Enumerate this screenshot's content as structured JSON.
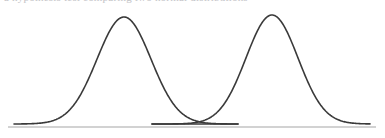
{
  "figure": {
    "width": 385,
    "height": 138,
    "background_color": "#ffffff",
    "clipped_text_fragment": "a hypothesis test comparing two normal distributions",
    "curve_color": "#3a3a3a",
    "baseline_color": "#d2d2d2",
    "curve_stroke_width": 1.6,
    "baseline_stroke_width": 2.0
  },
  "chart_data": {
    "type": "line",
    "title": "",
    "subtitle": "",
    "xlabel": "",
    "ylabel": "",
    "grid": false,
    "legend_position": "none",
    "axis_visible": false,
    "baseline_visible": true,
    "xlim": [
      0,
      385
    ],
    "ylim": [
      0,
      138
    ],
    "baseline_y": 127,
    "baselines": [
      {
        "name": "main-baseline",
        "x_start": 8,
        "x_end": 376,
        "y": 127
      },
      {
        "name": "inner-baseline",
        "x_start": 152,
        "x_end": 238,
        "y": 124
      }
    ],
    "intersection_point": {
      "x": 196,
      "y": 112
    },
    "series": [
      {
        "name": "Distribution A",
        "shape": "gaussian",
        "peak_x": 124,
        "peak_y": 17,
        "baseline_y": 124,
        "sigma": 27,
        "x_start": 14,
        "x_end": 238,
        "color": "#3a3a3a"
      },
      {
        "name": "Distribution B",
        "shape": "gaussian",
        "peak_x": 272,
        "peak_y": 15,
        "baseline_y": 124,
        "sigma": 26,
        "x_start": 152,
        "x_end": 370,
        "color": "#3a3a3a"
      }
    ]
  }
}
